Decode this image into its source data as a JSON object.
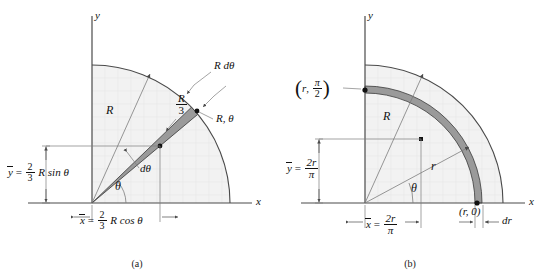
{
  "figure": {
    "background": "#ffffff",
    "shade_fill": "#f2f2f2",
    "band_fill": "#9a9a9a",
    "line_color": "#3a3a3a",
    "text_color": "#111111"
  },
  "panel_a": {
    "caption": "(a)",
    "axis_x_label": "x",
    "axis_y_label": "y",
    "radius_label": "R",
    "centroid_distance_label_num": "R",
    "centroid_distance_label_den": "3",
    "arc_length_label": "R dθ",
    "point_label": "R, θ",
    "angle_label": "θ",
    "d_theta_label": "dθ",
    "ybar_label": {
      "lhs": "y",
      "eq": "=",
      "frac_num": "2",
      "frac_den": "3",
      "rhs": "R sin θ"
    },
    "xbar_label": {
      "lhs": "x",
      "eq": "=",
      "frac_num": "2",
      "frac_den": "3",
      "rhs": "R cos θ"
    }
  },
  "panel_b": {
    "caption": "(b)",
    "axis_x_label": "x",
    "axis_y_label": "y",
    "radius_R_label": "R",
    "radius_r_label": "r",
    "angle_label": "θ",
    "point_top_label": {
      "r": "r",
      "frac_num": "π",
      "frac_den": "2"
    },
    "point_right_label": "(r, 0)",
    "dr_label": "dr",
    "ybar_label": {
      "lhs": "y",
      "eq": "=",
      "frac_num": "2r",
      "frac_den": "π"
    },
    "xbar_label": {
      "lhs": "x",
      "eq": "=",
      "frac_num": "2r",
      "frac_den": "π"
    }
  }
}
